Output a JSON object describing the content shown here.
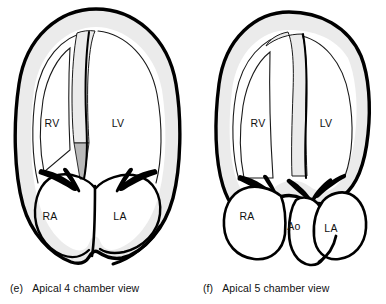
{
  "figure": {
    "colors": {
      "outline": "#000000",
      "myocardium": "#ebebeb",
      "septum_shadow": "#b9b9b9",
      "cavity": "#ffffff",
      "thin_line": "#1a1a1a",
      "text": "#101010"
    }
  },
  "panels": [
    {
      "id": "e",
      "caption_tag": "(e)",
      "caption_text": "Apical 4 chamber view",
      "labels": [
        {
          "key": "rv",
          "text": "RV",
          "x": 52,
          "y": 123
        },
        {
          "key": "lv",
          "text": "LV",
          "x": 118,
          "y": 123
        },
        {
          "key": "ra",
          "text": "RA",
          "x": 50,
          "y": 216
        },
        {
          "key": "la",
          "text": "LA",
          "x": 120,
          "y": 216
        }
      ]
    },
    {
      "id": "f",
      "caption_tag": "(f)",
      "caption_text": "Apical 5 chamber view",
      "labels": [
        {
          "key": "rv",
          "text": "RV",
          "x": 65,
          "y": 123
        },
        {
          "key": "lv",
          "text": "LV",
          "x": 133,
          "y": 123
        },
        {
          "key": "ra",
          "text": "RA",
          "x": 54,
          "y": 216
        },
        {
          "key": "ao",
          "text": "Ao",
          "x": 101,
          "y": 226
        },
        {
          "key": "la",
          "text": "LA",
          "x": 138,
          "y": 228
        }
      ]
    }
  ]
}
